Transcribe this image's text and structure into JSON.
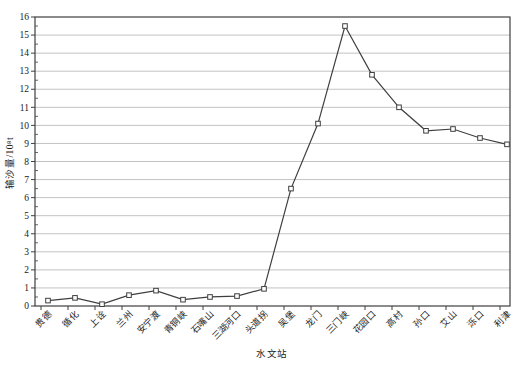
{
  "chart_data": {
    "type": "line",
    "title": "",
    "xlabel": "水文站",
    "ylabel": "输沙量/10⁸t",
    "ylim": [
      0,
      16
    ],
    "ytick_step": 1,
    "grid": "horizontal",
    "legend": "none",
    "marker": "open-square",
    "categories": [
      "贵德",
      "循化",
      "上诠",
      "兰州",
      "安宁渡",
      "青铜峡",
      "石嘴山",
      "三湖河口",
      "头道拐",
      "吴堡",
      "龙门",
      "三门峡",
      "花园口",
      "高村",
      "孙口",
      "艾山",
      "泺口",
      "利津"
    ],
    "series": [
      {
        "name": "输沙量",
        "values": [
          0.3,
          0.45,
          0.1,
          0.6,
          0.85,
          0.35,
          0.5,
          0.55,
          0.95,
          6.5,
          10.1,
          15.5,
          12.8,
          11.0,
          9.7,
          9.8,
          9.3,
          8.95
        ]
      }
    ]
  },
  "colors": {
    "background": "#ffffff",
    "axis": "#3f3f3f",
    "grid": "#c3c3c3",
    "line": "#3f3f3f",
    "marker_fill": "#ffffff",
    "text": "#1a1a1a"
  }
}
